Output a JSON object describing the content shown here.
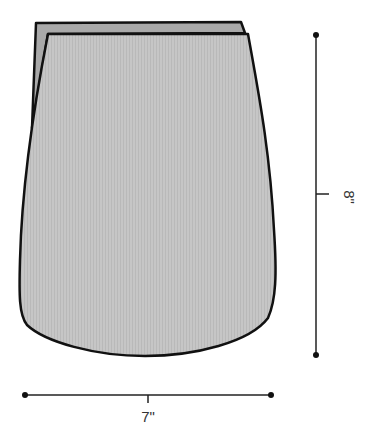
{
  "diagram": {
    "type": "pattern-piece-schematic",
    "colors": {
      "fill_front": "#c4c4c4",
      "fill_back": "#a8a8a8",
      "outline": "#111111",
      "dimension_line": "#222222",
      "label_text": "#333333"
    },
    "dimensions": {
      "width": {
        "label": "7\""
      },
      "height": {
        "label": "8\""
      }
    }
  }
}
